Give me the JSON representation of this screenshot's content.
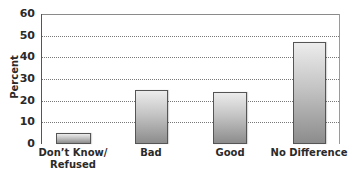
{
  "chart_data": {
    "type": "bar",
    "title": "",
    "xlabel": "",
    "ylabel": "Percent",
    "ylim": [
      0,
      60
    ],
    "yticks": [
      0,
      10,
      20,
      30,
      40,
      50,
      60
    ],
    "grid": true,
    "legend": null,
    "categories": [
      "Don’t Know/\nRefused",
      "Bad",
      "Good",
      "No Difference"
    ],
    "category_lines": [
      [
        "Don’t Know/",
        "Refused"
      ],
      [
        "Bad"
      ],
      [
        "Good"
      ],
      [
        "No Difference"
      ]
    ],
    "values": [
      5,
      25,
      24,
      47
    ]
  },
  "colors": {
    "bar_top": "#ececec",
    "bar_bottom": "#8c8c8c",
    "bar_border": "#555555",
    "text": "#2a2a2a"
  }
}
